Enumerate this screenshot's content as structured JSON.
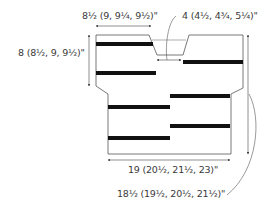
{
  "diagram": {
    "colors": {
      "outline": "#555555",
      "stripe": "#111111",
      "text": "#3a3a3a",
      "background": "#ffffff"
    },
    "labels": {
      "shoulder_width": "8½ (9, 9¼, 9½)\"",
      "neck_width": "4 (4½, 4¾, 5¼)\"",
      "armhole_depth": "8 (8½, 9, 9½)\"",
      "body_width": "19 (20½, 21½, 23)\"",
      "body_length": "18½ (19½, 20½, 21½)\""
    },
    "stripes": [
      {
        "x": 96,
        "y": 42,
        "w": 57
      },
      {
        "x": 96,
        "y": 71,
        "w": 60
      },
      {
        "x": 183,
        "y": 60,
        "w": 60
      },
      {
        "x": 170,
        "y": 94,
        "w": 60
      },
      {
        "x": 108,
        "y": 105,
        "w": 62
      },
      {
        "x": 170,
        "y": 124,
        "w": 60
      },
      {
        "x": 108,
        "y": 136,
        "w": 62
      }
    ]
  }
}
